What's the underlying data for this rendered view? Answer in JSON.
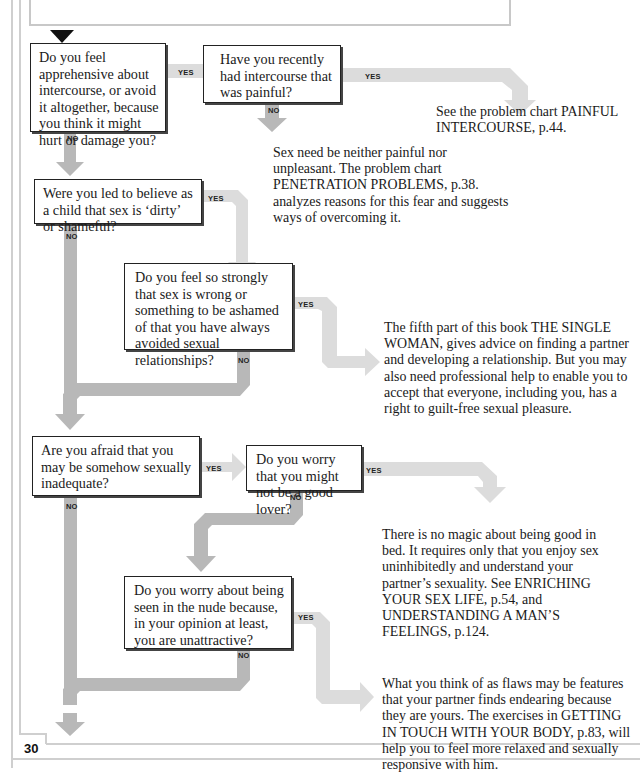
{
  "page": {
    "header_title_fragment": "NGS",
    "page_number": "30"
  },
  "labels": {
    "yes": "YES",
    "no": "NO"
  },
  "colors": {
    "arrow_dark": "#b8b8b8",
    "arrow_light": "#dcdcdc",
    "box_border": "#222222",
    "frame": "#cfcfcf"
  },
  "questions": [
    {
      "id": "q1",
      "text": "Do you feel apprehensive about intercourse, or avoid it altogether, because you think it might hurt or damage you?"
    },
    {
      "id": "q2",
      "text": "Have you recently had intercourse that was painful?"
    },
    {
      "id": "q3",
      "text": "Were you led to believe as a child that sex is ‘dirty’ or shameful?"
    },
    {
      "id": "q4",
      "text": "Do you feel so strongly that sex is wrong or something to be ashamed of that you have always avoided sexual relationships?"
    },
    {
      "id": "q5",
      "text": "Are you afraid that you may be somehow sexually inadequate?"
    },
    {
      "id": "q6",
      "text": "Do you worry that you might not be a good lover?"
    },
    {
      "id": "q7",
      "text": "Do you worry about being seen in the nude because, in your opinion at least, you are unattractive?"
    }
  ],
  "answers": [
    {
      "id": "a1",
      "text": "See the problem chart PAINFUL INTERCOURSE, p.44."
    },
    {
      "id": "a2",
      "text": "Sex need be neither painful nor unpleasant. The problem chart PENETRATION PROBLEMS, p.38. analyzes reasons for this fear and suggests ways of overcoming it."
    },
    {
      "id": "a3",
      "text": "The fifth part of this book THE SINGLE WOMAN, gives advice on finding a partner and developing a relationship. But you may also need professional help to enable you to accept that everyone, including you, has a right to guilt-free sexual pleasure."
    },
    {
      "id": "a4",
      "text": "There is no magic about being good in bed. It requires only that you enjoy sex uninhibitedly and understand your partner’s sexuality. See ENRICHING YOUR SEX LIFE, p.54, and UNDERSTANDING A MAN’S FEELINGS, p.124."
    },
    {
      "id": "a5",
      "text": "What you think of as flaws may be features that your partner finds endearing because they are yours. The exercises in GETTING IN TOUCH WITH YOUR BODY, p.83, will help you to feel more relaxed and sexually responsive with him."
    }
  ]
}
